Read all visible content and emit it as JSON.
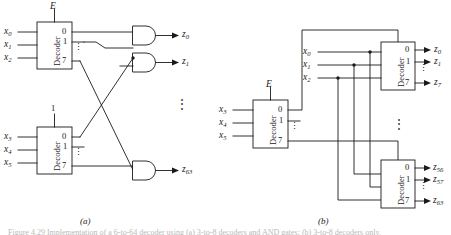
{
  "figure": {
    "caption_left": "(a)",
    "caption_right": "(b)",
    "bottom_caption": "Figure 4.29 Implementation of a 6-to-64 decoder using (a) 3-to-8 decoders and AND gates; (b) 3-to-8 decoders only.",
    "decoder_word": "Decoder",
    "vdots": "⋮"
  },
  "panel_a": {
    "label": "(a)",
    "enable_label": "E",
    "enable_const": "1",
    "decoder_top": {
      "name": "Decoder",
      "inputs": [
        "x",
        "x",
        "x"
      ],
      "input_subs": [
        "0",
        "1",
        "2"
      ],
      "outputs": [
        "0",
        "1",
        "7"
      ],
      "dots": "⋮"
    },
    "decoder_bottom": {
      "name": "Decoder",
      "inputs": [
        "x",
        "x",
        "x"
      ],
      "input_subs": [
        "3",
        "4",
        "5"
      ],
      "outputs": [
        "0",
        "1",
        "7"
      ],
      "dots": "⋮"
    },
    "gates": [
      {
        "type": "AND",
        "output": "z",
        "output_sub": "0"
      },
      {
        "type": "AND",
        "output": "z",
        "output_sub": "1"
      },
      {
        "type": "AND",
        "output": "z",
        "output_sub": "63"
      }
    ],
    "middle_dots": "⋮"
  },
  "panel_b": {
    "label": "(b)",
    "enable_label": "E",
    "decoder_left": {
      "name": "Decoder",
      "inputs": [
        "x",
        "x",
        "x"
      ],
      "input_subs": [
        "3",
        "4",
        "5"
      ],
      "outputs": [
        "0",
        "1",
        "7"
      ],
      "dots": "⋮"
    },
    "decoder_top": {
      "name": "Decoder",
      "inputs": [
        "x",
        "x",
        "x"
      ],
      "input_subs": [
        "0",
        "1",
        "2"
      ],
      "outputs": [
        "0",
        "1",
        "7"
      ],
      "out_labels": [
        "z",
        "z",
        "z"
      ],
      "out_subs": [
        "0",
        "1",
        "7"
      ],
      "dots": "⋮"
    },
    "decoder_bottom": {
      "name": "Decoder",
      "outputs": [
        "0",
        "1",
        "7"
      ],
      "out_labels": [
        "z",
        "z",
        "z"
      ],
      "out_subs": [
        "56",
        "57",
        "63"
      ],
      "dots": "⋮"
    },
    "middle_dots": "⋮"
  },
  "colors": {
    "ink": "#1a1a1a",
    "background": "#ffffff"
  }
}
